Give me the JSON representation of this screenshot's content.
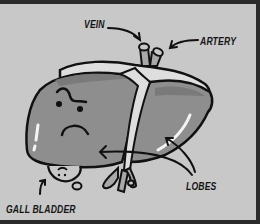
{
  "diagram": {
    "style": "grayscale cartoon",
    "labels": {
      "vein": "VEIN",
      "artery": "ARTERY",
      "lobes": "LOBES",
      "gall_bladder": "GALL BLADDER"
    },
    "colors": {
      "background": "#c8c8c8",
      "frame": "#2b2b2b",
      "lobe_fill": "#8e8e8e",
      "lobe_shade": "#7a7a7a",
      "ligament": "#dedede",
      "outline": "#111111",
      "highlight": "#f4f4f4"
    }
  }
}
